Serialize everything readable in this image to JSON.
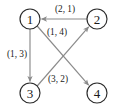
{
  "diagram": {
    "background_color": "#ffffff",
    "node_stroke_color": "#2b2b2b",
    "edge_color": "#8a8a8a",
    "text_color": "#1a1a1a",
    "nodes": [
      {
        "id": "1",
        "label": "1",
        "cx": 30,
        "cy": 19,
        "r": 10
      },
      {
        "id": "2",
        "label": "2",
        "cx": 97,
        "cy": 19,
        "r": 10
      },
      {
        "id": "3",
        "label": "3",
        "cx": 30,
        "cy": 93,
        "r": 10
      },
      {
        "id": "4",
        "label": "4",
        "cx": 97,
        "cy": 93,
        "r": 10
      }
    ],
    "edges": [
      {
        "id": "edge-2-to-1",
        "from": "2",
        "to": "1",
        "directed": true,
        "label": "(2, 1)",
        "label_x": 65,
        "label_y": 9
      },
      {
        "id": "edge-1-to-3",
        "from": "1",
        "to": "3",
        "directed": true,
        "label": "(1, 3)",
        "label_x": 17,
        "label_y": 54
      },
      {
        "id": "edge-3-to-2",
        "from": "3",
        "to": "2",
        "directed": true,
        "label": "(1, 4)",
        "label_x": 57,
        "label_y": 32
      },
      {
        "id": "edge-1-to-4",
        "from": "1",
        "to": "4",
        "directed": true,
        "label": "(3, 2)",
        "label_x": 58,
        "label_y": 79
      }
    ]
  }
}
